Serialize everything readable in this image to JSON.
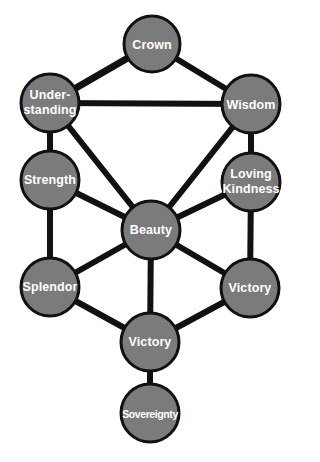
{
  "diagram": {
    "type": "tree-of-life-network",
    "colors": {
      "node_fill": "#7b7b7b",
      "node_stroke": "#111111",
      "edge": "#111111",
      "label": "#ffffff",
      "background": "#ffffff"
    },
    "nodes": [
      {
        "id": "crown",
        "label": "Crown",
        "x": 152,
        "y": 44,
        "r": 28
      },
      {
        "id": "understanding",
        "label": "Under-\nstanding",
        "x": 50,
        "y": 103,
        "r": 29
      },
      {
        "id": "wisdom",
        "label": "Wisdom",
        "x": 251,
        "y": 104,
        "r": 29
      },
      {
        "id": "strength",
        "label": "Strength",
        "x": 50,
        "y": 180,
        "r": 29
      },
      {
        "id": "loving_kindness",
        "label": "Loving\nKindness",
        "x": 251,
        "y": 182,
        "r": 29
      },
      {
        "id": "beauty",
        "label": "Beauty",
        "x": 151,
        "y": 230,
        "r": 29
      },
      {
        "id": "splendor",
        "label": "Splendor",
        "x": 50,
        "y": 287,
        "r": 29
      },
      {
        "id": "victory_right",
        "label": "Victory",
        "x": 250,
        "y": 288,
        "r": 29
      },
      {
        "id": "victory_bottom",
        "label": "Victory",
        "x": 150,
        "y": 342,
        "r": 29
      },
      {
        "id": "sovereignty",
        "label": "Sovereignty",
        "x": 150,
        "y": 413,
        "r": 29
      }
    ],
    "edges": [
      [
        "crown",
        "understanding"
      ],
      [
        "crown",
        "wisdom"
      ],
      [
        "understanding",
        "wisdom"
      ],
      [
        "understanding",
        "strength"
      ],
      [
        "understanding",
        "beauty"
      ],
      [
        "wisdom",
        "loving_kindness"
      ],
      [
        "wisdom",
        "beauty"
      ],
      [
        "strength",
        "beauty"
      ],
      [
        "strength",
        "splendor"
      ],
      [
        "loving_kindness",
        "beauty"
      ],
      [
        "loving_kindness",
        "victory_right"
      ],
      [
        "beauty",
        "splendor"
      ],
      [
        "beauty",
        "victory_right"
      ],
      [
        "beauty",
        "victory_bottom"
      ],
      [
        "splendor",
        "victory_bottom"
      ],
      [
        "victory_right",
        "victory_bottom"
      ],
      [
        "victory_bottom",
        "sovereignty"
      ]
    ]
  },
  "labels": {
    "crown": "Crown",
    "understanding_1": "Under-",
    "understanding_2": "standing",
    "wisdom": "Wisdom",
    "strength": "Strength",
    "loving_kindness_1": "Loving",
    "loving_kindness_2": "Kindness",
    "beauty": "Beauty",
    "splendor": "Splendor",
    "victory_right": "Victory",
    "victory_bottom": "Victory",
    "sovereignty": "Sovereignty"
  }
}
